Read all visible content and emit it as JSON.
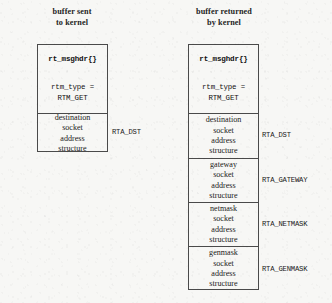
{
  "diagram": {
    "background_color": "#f7f7f5",
    "line_color": "#4a4a4a",
    "columns": [
      {
        "id": "sent",
        "heading_line1": "buffer sent",
        "heading_line2": "to kernel",
        "segments": [
          {
            "id": "header",
            "struct_name": "rt_msghdr{}",
            "field_line1": "rtm_type =",
            "field_line2": "RTM_GET",
            "rta_label": ""
          },
          {
            "id": "destination",
            "line1": "destination",
            "line2": "socket",
            "line3": "address",
            "line4": "structure",
            "rta_label": "RTA_DST"
          }
        ]
      },
      {
        "id": "returned",
        "heading_line1": "buffer returned",
        "heading_line2": "by kernel",
        "segments": [
          {
            "id": "header",
            "struct_name": "rt_msghdr{}",
            "field_line1": "rtm_type =",
            "field_line2": "RTM_GET",
            "rta_label": ""
          },
          {
            "id": "destination",
            "line1": "destination",
            "line2": "socket",
            "line3": "address",
            "line4": "structure",
            "rta_label": "RTA_DST"
          },
          {
            "id": "gateway",
            "line1": "gateway",
            "line2": "socket",
            "line3": "address",
            "line4": "structure",
            "rta_label": "RTA_GATEWAY"
          },
          {
            "id": "netmask",
            "line1": "netmask",
            "line2": "socket",
            "line3": "address",
            "line4": "structure",
            "rta_label": "RTA_NETMASK"
          },
          {
            "id": "genmask",
            "line1": "genmask",
            "line2": "socket",
            "line3": "address",
            "line4": "structure",
            "rta_label": "RTA_GENMASK"
          }
        ]
      }
    ]
  }
}
